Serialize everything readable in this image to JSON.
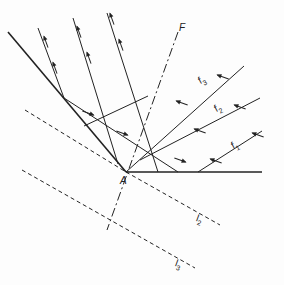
{
  "diagram": {
    "title": "",
    "labels": {
      "point_a": "A",
      "axis_f": "F",
      "f3": "f",
      "f3_sub": "3",
      "f2": "f",
      "f2_sub": "2",
      "f1": "f",
      "f1_sub": "1",
      "l2": "l",
      "l2_sub": "2",
      "l3": "l",
      "l3_sub": "3"
    },
    "colors": {
      "ink": "#222222",
      "background": "#fdfdfd"
    },
    "solid_lines": [
      {
        "name": "wall-left",
        "x1": 8,
        "y1": 32,
        "x2": 126,
        "y2": 172,
        "w": 1.6
      },
      {
        "name": "wall-base",
        "x1": 126,
        "y1": 172,
        "x2": 262,
        "y2": 172,
        "w": 1.6
      },
      {
        "name": "ray-1-incident",
        "x1": 38,
        "y1": 28,
        "x2": 64,
        "y2": 98,
        "w": 1
      },
      {
        "name": "ray-1-reflect",
        "x1": 64,
        "y1": 98,
        "x2": 178,
        "y2": 172,
        "w": 1
      },
      {
        "name": "ray-2-incident",
        "x1": 73,
        "y1": 18,
        "x2": 118,
        "y2": 164,
        "w": 1
      },
      {
        "name": "ray-3-incident",
        "x1": 107,
        "y1": 13,
        "x2": 158,
        "y2": 172,
        "w": 1
      },
      {
        "name": "ray-2-cross",
        "x1": 84,
        "y1": 126,
        "x2": 148,
        "y2": 96,
        "w": 1
      },
      {
        "name": "f3-line",
        "x1": 126,
        "y1": 172,
        "x2": 244,
        "y2": 66,
        "w": 1
      },
      {
        "name": "f2-line",
        "x1": 140,
        "y1": 160,
        "x2": 260,
        "y2": 98,
        "w": 1
      },
      {
        "name": "f1-line",
        "x1": 198,
        "y1": 172,
        "x2": 262,
        "y2": 131,
        "w": 1
      }
    ],
    "dashed_lines": [
      {
        "name": "l1-dashed",
        "x1": 25,
        "y1": 110,
        "x2": 126,
        "y2": 172
      },
      {
        "name": "l2-dashed",
        "x1": 126,
        "y1": 172,
        "x2": 220,
        "y2": 225
      },
      {
        "name": "l3-dashed",
        "x1": 22,
        "y1": 170,
        "x2": 195,
        "y2": 268
      }
    ],
    "dashdot_lines": [
      {
        "name": "axis-f",
        "x1": 178,
        "y1": 32,
        "x2": 107,
        "y2": 230
      }
    ],
    "arrows": [
      {
        "name": "arrow-r1-a",
        "x": 46,
        "y": 42,
        "angle": -20
      },
      {
        "name": "arrow-r1-b",
        "x": 55,
        "y": 68,
        "angle": -20
      },
      {
        "name": "arrow-r2-a",
        "x": 79,
        "y": 32,
        "angle": -20
      },
      {
        "name": "arrow-r2-b",
        "x": 89,
        "y": 58,
        "angle": -20
      },
      {
        "name": "arrow-r3-a",
        "x": 112,
        "y": 19,
        "angle": -20
      },
      {
        "name": "arrow-r3-b",
        "x": 121,
        "y": 45,
        "angle": -20
      },
      {
        "name": "arrow-reflect-1",
        "x": 88,
        "y": 113,
        "angle": 110
      },
      {
        "name": "arrow-reflect-2",
        "x": 122,
        "y": 133,
        "angle": 110
      },
      {
        "name": "arrow-reflect-3",
        "x": 180,
        "y": 160,
        "angle": 110
      },
      {
        "name": "arrow-f3-a",
        "x": 182,
        "y": 103,
        "angle": -70
      },
      {
        "name": "arrow-f3-b",
        "x": 223,
        "y": 77,
        "angle": -70
      },
      {
        "name": "arrow-f2-a",
        "x": 200,
        "y": 131,
        "angle": -70
      },
      {
        "name": "arrow-f2-b",
        "x": 240,
        "y": 107,
        "angle": -70
      },
      {
        "name": "arrow-f1-a",
        "x": 216,
        "y": 161,
        "angle": -70
      },
      {
        "name": "arrow-f1-b",
        "x": 258,
        "y": 135,
        "angle": -70
      }
    ]
  }
}
